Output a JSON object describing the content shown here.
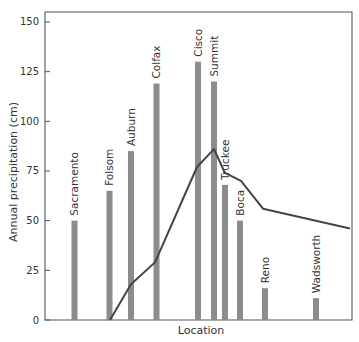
{
  "chart_data": {
    "type": "bar",
    "title": "",
    "xlabel": "Location",
    "ylabel": "Annual precipitation (cm)",
    "ylim": [
      0,
      150
    ],
    "yticks": [
      0,
      25,
      50,
      75,
      100,
      125,
      150
    ],
    "grid": false,
    "legend": null,
    "categories": [
      "Sacramento",
      "Folsom",
      "Auburn",
      "Colfax",
      "Cisco",
      "Summit",
      "Truckee",
      "Boca",
      "Reno",
      "Wadsworth"
    ],
    "series": [
      {
        "name": "Annual precipitation",
        "kind": "bar",
        "color": "#8c8c8c",
        "values": [
          50,
          65,
          85,
          119,
          130,
          120,
          68,
          50,
          16,
          11
        ],
        "x_px": [
          74.5,
          109.5,
          131,
          156.5,
          198,
          214,
          225,
          240,
          265,
          316
        ]
      },
      {
        "name": "Elevation profile",
        "kind": "line",
        "color": "#444444",
        "points_px": [
          [
            110,
            0
          ],
          [
            131,
            18
          ],
          [
            155,
            29
          ],
          [
            197,
            77
          ],
          [
            214,
            86
          ],
          [
            225,
            74
          ],
          [
            241,
            70
          ],
          [
            263,
            56
          ],
          [
            350,
            46
          ]
        ]
      }
    ]
  },
  "layout": {
    "plot_left": 45,
    "plot_right": 352,
    "plot_top": 12,
    "plot_bottom": 320,
    "px_per_unit": 1.987,
    "bar_width": 6
  }
}
